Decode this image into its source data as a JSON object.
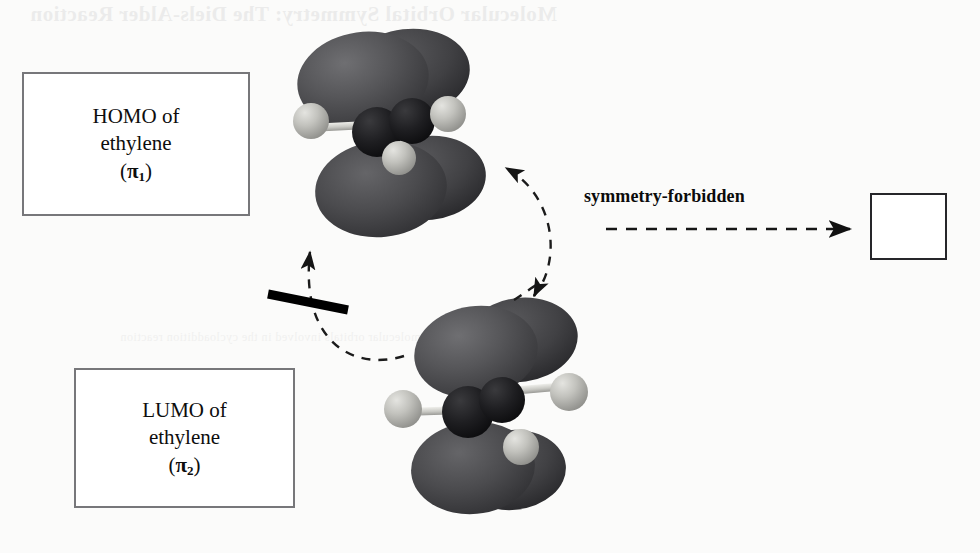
{
  "figure": {
    "caption_bleed": "Molecular Orbital Symmetry: The Diels-Alder Reaction",
    "bleed_line_2": "the molecular orbitals involved in the cycloaddition reaction"
  },
  "homo": {
    "line1": "HOMO of",
    "line2": "ethylene",
    "open_paren": "(",
    "symbol": "π",
    "subscript": "1",
    "close_paren": ")",
    "orbital_label": "π₁"
  },
  "lumo": {
    "line1": "LUMO of",
    "line2": "ethylene",
    "open_paren": "(",
    "symbol": "π",
    "subscript": "2",
    "close_paren": ")",
    "orbital_label": "π₂"
  },
  "reaction": {
    "label": "symmetry-forbidden",
    "product_name": "cyclobutane",
    "arrow_style": "dashed",
    "arrow_direction": "right"
  },
  "interaction": {
    "arc_upper_name": "homo-lumo-interaction-arc",
    "arc_lower_name": "lumo-homo-interaction-arc",
    "blocked_marker": "forbidden-slash-bar",
    "blocked": true
  },
  "colors": {
    "page_background": "#fbfbfa",
    "box_border": "#77777a",
    "product_border": "#26262a",
    "text": "#0d0d0d",
    "orbital_lobe_dark": "#4a4a4c",
    "orbital_lobe_shadow": "#2b2b2d",
    "orbital_lobe_highlight": "#6d6d70",
    "carbon_atom": "#1b1b1d",
    "hydrogen_atom": "#b9b9b6",
    "bond": "#cfcfca",
    "arrow": "#1a1a1a",
    "slash_bar": "#000000"
  },
  "molecules": {
    "homo_model": {
      "name": "ethylene-homo-pi1-model",
      "description": "ethylene pi1 bonding orbital, one lobe above and one lobe below the molecular plane",
      "lobes": 2
    },
    "lumo_model": {
      "name": "ethylene-lumo-pi2-model",
      "description": "ethylene pi2 antibonding orbital with a nodal plane between the carbons",
      "lobes": 2
    }
  }
}
